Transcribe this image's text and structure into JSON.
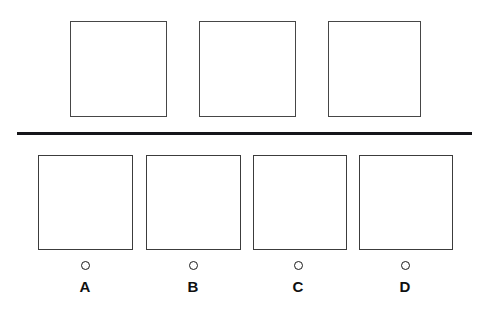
{
  "page": {
    "title": "",
    "background_color": "#ffffff",
    "width": 489,
    "height": 315
  },
  "stimulus": {
    "name": "stimulus-row",
    "frame_count": 3,
    "frames": [
      {
        "id": "1",
        "content": "",
        "label": ""
      },
      {
        "id": "2",
        "content": "",
        "label": ""
      },
      {
        "id": "3",
        "content": "",
        "label": ""
      }
    ]
  },
  "divider": {
    "name": "horizontal-rule",
    "color": "#16161a"
  },
  "options": {
    "name": "answer-options-row",
    "selected": "",
    "items": [
      {
        "letter": "A",
        "content": "",
        "selected": false
      },
      {
        "letter": "B",
        "content": "",
        "selected": false
      },
      {
        "letter": "C",
        "content": "",
        "selected": false
      },
      {
        "letter": "D",
        "content": "",
        "selected": false
      }
    ]
  },
  "colors": {
    "frame_border": "#3a3a3a",
    "rule": "#16161a",
    "label_text": "#101010",
    "bubble_border": "#1c1c1c"
  }
}
